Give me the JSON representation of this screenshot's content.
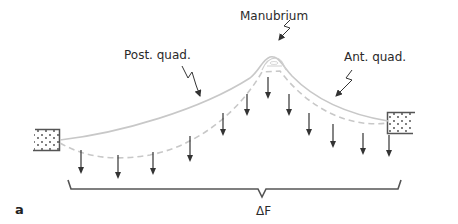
{
  "diagram": {
    "labels": {
      "manubrium": "Manubrium",
      "post_quad": "Post. quad.",
      "ant_quad": "Ant. quad.",
      "delta_f": "ΔF",
      "panel": "a"
    },
    "colors": {
      "curve": "#c8c8c8",
      "arrow": "#333333",
      "brace": "#555555",
      "box": "#555555"
    },
    "force_arrows": [
      {
        "x": 81,
        "y1": 150,
        "y2": 174
      },
      {
        "x": 118,
        "y1": 155,
        "y2": 179
      },
      {
        "x": 153,
        "y1": 152,
        "y2": 175
      },
      {
        "x": 190,
        "y1": 136,
        "y2": 162
      },
      {
        "x": 223,
        "y1": 113,
        "y2": 136
      },
      {
        "x": 247,
        "y1": 94,
        "y2": 116
      },
      {
        "x": 268,
        "y1": 77,
        "y2": 99
      },
      {
        "x": 289,
        "y1": 94,
        "y2": 116
      },
      {
        "x": 309,
        "y1": 113,
        "y2": 136
      },
      {
        "x": 333,
        "y1": 124,
        "y2": 148
      },
      {
        "x": 363,
        "y1": 133,
        "y2": 155
      },
      {
        "x": 389,
        "y1": 135,
        "y2": 157
      }
    ]
  }
}
